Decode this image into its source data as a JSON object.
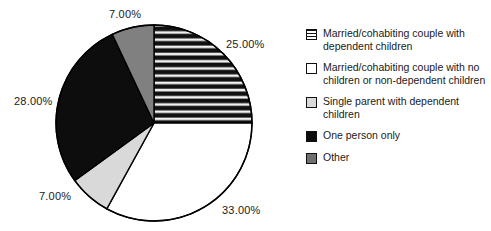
{
  "chart_data": {
    "type": "pie",
    "title": "",
    "subtitle": "",
    "xlabel": "",
    "ylabel": "",
    "legend_position": "right",
    "grid": false,
    "start_angle_deg": 0,
    "direction": "clockwise",
    "categories": [
      "Married/cohabiting couple with dependent children",
      "Married/cohabiting couple with no children or non-dependent children",
      "Single parent with dependent children",
      "One person only",
      "Other"
    ],
    "values": [
      25.0,
      33.0,
      7.0,
      28.0,
      7.0
    ],
    "value_labels": [
      "25.00%",
      "33.00%",
      "7.00%",
      "28.00%",
      "7.00%"
    ],
    "slice_styles": [
      "horizontal-stripes",
      "white",
      "light-gray",
      "black",
      "medium-gray"
    ],
    "slice_colors": [
      "#1c1c1c",
      "#ffffff",
      "#d9d9d9",
      "#0d0d0d",
      "#808080"
    ],
    "outline_color": "#000000"
  },
  "pie": {
    "center_x": 154,
    "center_y": 123,
    "radius": 98,
    "labels": [
      {
        "text": "25.00%",
        "left": 226,
        "top": 38
      },
      {
        "text": "33.00%",
        "left": 222,
        "top": 204
      },
      {
        "text": "7.00%",
        "left": 39,
        "top": 190
      },
      {
        "text": "28.00%",
        "left": 14,
        "top": 95
      },
      {
        "text": "7.00%",
        "left": 109,
        "top": 8
      }
    ]
  },
  "legend": {
    "items": [
      {
        "label": "Married/cohabiting couple with dependent children",
        "swatch": "horizontal-stripes",
        "swatch_name": "legend-swatch-striped"
      },
      {
        "label": "Married/cohabiting couple with no children or non-dependent children",
        "swatch": "white",
        "swatch_name": "legend-swatch-white"
      },
      {
        "label": "Single parent with dependent children",
        "swatch": "light-gray",
        "swatch_name": "legend-swatch-light-gray"
      },
      {
        "label": "One person only",
        "swatch": "black",
        "swatch_name": "legend-swatch-black"
      },
      {
        "label": "Other",
        "swatch": "medium-gray",
        "swatch_name": "legend-swatch-medium-gray"
      }
    ]
  }
}
